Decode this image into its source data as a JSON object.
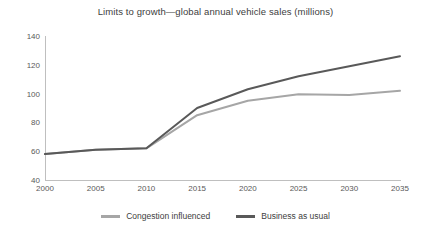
{
  "chart_data": {
    "type": "line",
    "title": "Limits to growth—global annual vehicle sales (millions)",
    "xlabel": "",
    "ylabel": "",
    "x": [
      2000,
      2005,
      2010,
      2015,
      2020,
      2025,
      2030,
      2035
    ],
    "categories": [
      "2000",
      "2005",
      "2010",
      "2015",
      "2020",
      "2025",
      "2030",
      "2035"
    ],
    "xlim": [
      2000,
      2035
    ],
    "ylim": [
      40,
      140
    ],
    "yticks": [
      40,
      60,
      80,
      100,
      120,
      140
    ],
    "grid": false,
    "legend_position": "bottom",
    "series": [
      {
        "name": "Congestion influenced",
        "color": "#a6a6a6",
        "values": [
          58,
          61,
          62,
          85,
          95,
          99.5,
          99,
          102
        ]
      },
      {
        "name": "Business as usual",
        "color": "#595959",
        "values": [
          58,
          61,
          62,
          90,
          103,
          112,
          119,
          126
        ]
      }
    ]
  },
  "legend": {
    "items": [
      {
        "label": "Congestion influenced",
        "color": "#a6a6a6"
      },
      {
        "label": "Business as usual",
        "color": "#595959"
      }
    ]
  }
}
